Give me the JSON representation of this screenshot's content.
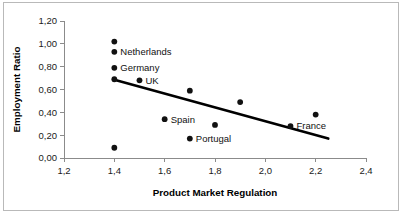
{
  "chart_data": {
    "type": "scatter",
    "title": "",
    "xlabel": "Product Market Regulation",
    "ylabel": "Employment Ratio",
    "xlim": [
      1.2,
      2.4
    ],
    "ylim": [
      0.0,
      1.2
    ],
    "grid": false,
    "legend": "none",
    "decimal_separator": ",",
    "x_ticks": [
      "1,2",
      "1,4",
      "1,6",
      "1,8",
      "2,0",
      "2,2",
      "2,4"
    ],
    "x_tick_values": [
      1.2,
      1.4,
      1.6,
      1.8,
      2.0,
      2.2,
      2.4
    ],
    "y_ticks": [
      "0,00",
      "0,20",
      "0,40",
      "0,60",
      "0,80",
      "1,00",
      "1,20"
    ],
    "y_tick_values": [
      0.0,
      0.2,
      0.4,
      0.6,
      0.8,
      1.0,
      1.2
    ],
    "points": [
      {
        "x": 1.4,
        "y": 1.02,
        "label": ""
      },
      {
        "x": 1.4,
        "y": 0.93,
        "label": "Netherlands"
      },
      {
        "x": 1.4,
        "y": 0.79,
        "label": "Germany"
      },
      {
        "x": 1.4,
        "y": 0.69,
        "label": ""
      },
      {
        "x": 1.5,
        "y": 0.68,
        "label": "UK"
      },
      {
        "x": 1.7,
        "y": 0.59,
        "label": ""
      },
      {
        "x": 1.9,
        "y": 0.49,
        "label": ""
      },
      {
        "x": 1.6,
        "y": 0.34,
        "label": "Spain"
      },
      {
        "x": 1.8,
        "y": 0.29,
        "label": ""
      },
      {
        "x": 1.7,
        "y": 0.17,
        "label": "Portugal"
      },
      {
        "x": 2.2,
        "y": 0.38,
        "label": ""
      },
      {
        "x": 2.1,
        "y": 0.28,
        "label": "France"
      },
      {
        "x": 1.4,
        "y": 0.09,
        "label": ""
      }
    ],
    "trendline": {
      "type": "linear",
      "x_start": 1.4,
      "y_start": 0.685,
      "x_end": 2.25,
      "y_end": 0.17
    }
  }
}
